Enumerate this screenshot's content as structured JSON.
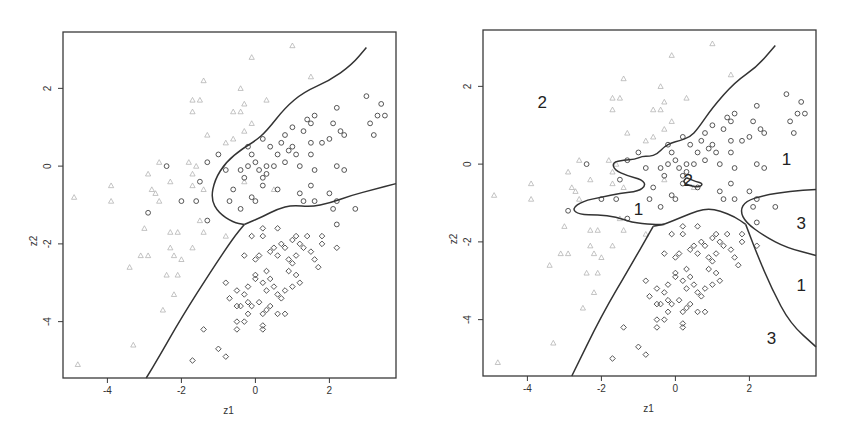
{
  "chart_data": [
    {
      "type": "scatter",
      "title": "",
      "xlabel": "z1",
      "ylabel": "z2",
      "xlim": [
        -5.2,
        3.8
      ],
      "ylim": [
        -5.45,
        3.45
      ],
      "xticks": [
        -4,
        -2,
        0,
        2
      ],
      "yticks": [
        -4,
        -2,
        0,
        2
      ],
      "grid": false,
      "legend": "none",
      "markers": {
        "class1": "circle",
        "class2": "triangle (light)",
        "class3": "diamond"
      },
      "boundaries": [
        {
          "name": "class1-vs-class2",
          "points": [
            [
              3.0,
              3.05
            ],
            [
              2.6,
              2.6
            ],
            [
              2.0,
              2.2
            ],
            [
              1.3,
              1.9
            ],
            [
              0.8,
              1.5
            ],
            [
              0.3,
              0.9
            ],
            [
              0.0,
              0.65
            ],
            [
              -0.35,
              0.45
            ],
            [
              -0.8,
              0.1
            ],
            [
              -1.1,
              -0.35
            ],
            [
              -1.2,
              -0.85
            ],
            [
              -1.0,
              -1.2
            ],
            [
              -0.6,
              -1.45
            ],
            [
              -0.3,
              -1.5
            ]
          ]
        },
        {
          "name": "class1-vs-class3",
          "points": [
            [
              -0.3,
              -1.5
            ],
            [
              0.2,
              -1.3
            ],
            [
              0.6,
              -1.1
            ],
            [
              1.0,
              -1.0
            ],
            [
              1.5,
              -1.05
            ],
            [
              2.0,
              -0.95
            ],
            [
              2.6,
              -0.75
            ],
            [
              3.2,
              -0.6
            ],
            [
              3.8,
              -0.45
            ]
          ]
        },
        {
          "name": "class2-vs-class3",
          "points": [
            [
              -0.3,
              -1.5
            ],
            [
              -0.6,
              -1.85
            ],
            [
              -1.2,
              -2.7
            ],
            [
              -2.0,
              -3.9
            ],
            [
              -2.6,
              -4.9
            ],
            [
              -2.95,
              -5.45
            ]
          ]
        }
      ]
    },
    {
      "type": "scatter",
      "title": "",
      "xlabel": "z1",
      "ylabel": "z2",
      "xlim": [
        -5.2,
        3.8
      ],
      "ylim": [
        -5.45,
        3.45
      ],
      "xticks": [
        -4,
        -2,
        0,
        2
      ],
      "yticks": [
        -4,
        -2,
        0,
        2
      ],
      "grid": false,
      "legend": "none",
      "region_labels": [
        {
          "text": "2",
          "x": -3.6,
          "y": 1.55
        },
        {
          "text": "1",
          "x": 3.0,
          "y": 0.1
        },
        {
          "text": "1",
          "x": -1.0,
          "y": -1.2
        },
        {
          "text": "2",
          "x": 0.35,
          "y": -0.45
        },
        {
          "text": "3",
          "x": 3.4,
          "y": -1.55
        },
        {
          "text": "1",
          "x": 3.4,
          "y": -3.15
        },
        {
          "text": "3",
          "x": 2.6,
          "y": -4.5
        }
      ],
      "boundaries": [
        {
          "name": "upper",
          "points": [
            [
              2.7,
              3.05
            ],
            [
              2.2,
              2.5
            ],
            [
              1.6,
              2.1
            ],
            [
              1.0,
              1.45
            ],
            [
              0.6,
              0.9
            ],
            [
              0.4,
              0.7
            ],
            [
              0.1,
              0.6
            ],
            [
              -0.1,
              0.55
            ],
            [
              -0.3,
              0.45
            ],
            [
              -0.5,
              0.25
            ],
            [
              -0.7,
              0.2
            ],
            [
              -0.9,
              0.2
            ],
            [
              -1.1,
              0.12
            ],
            [
              -1.4,
              0.1
            ],
            [
              -1.7,
              0.05
            ],
            [
              -1.65,
              -0.15
            ],
            [
              -1.3,
              -0.3
            ],
            [
              -0.9,
              -0.4
            ],
            [
              -0.8,
              -0.55
            ],
            [
              -1.0,
              -0.7
            ],
            [
              -1.5,
              -0.75
            ],
            [
              -2.0,
              -0.85
            ],
            [
              -2.5,
              -0.95
            ],
            [
              -2.8,
              -1.15
            ],
            [
              -2.6,
              -1.3
            ],
            [
              -2.1,
              -1.3
            ],
            [
              -1.6,
              -1.35
            ],
            [
              -1.2,
              -1.5
            ],
            [
              -0.6,
              -1.55
            ],
            [
              -0.3,
              -1.55
            ]
          ]
        },
        {
          "name": "small-loop",
          "points": [
            [
              0.3,
              -0.35
            ],
            [
              0.55,
              -0.45
            ],
            [
              0.75,
              -0.5
            ],
            [
              0.65,
              -0.6
            ],
            [
              0.35,
              -0.55
            ],
            [
              0.2,
              -0.45
            ],
            [
              0.3,
              -0.35
            ]
          ]
        },
        {
          "name": "middle",
          "points": [
            [
              -0.6,
              -1.6
            ],
            [
              -0.3,
              -1.55
            ],
            [
              0.2,
              -1.35
            ],
            [
              0.6,
              -1.2
            ],
            [
              0.9,
              -1.15
            ],
            [
              1.2,
              -1.2
            ],
            [
              1.6,
              -1.35
            ],
            [
              1.9,
              -1.55
            ]
          ]
        },
        {
          "name": "left-wedge",
          "points": [
            [
              -0.6,
              -1.6
            ],
            [
              -1.2,
              -2.6
            ],
            [
              -2.0,
              -3.9
            ],
            [
              -2.8,
              -5.45
            ]
          ]
        },
        {
          "name": "right-lower",
          "points": [
            [
              1.9,
              -1.55
            ],
            [
              2.2,
              -2.3
            ],
            [
              2.6,
              -3.2
            ],
            [
              3.1,
              -4.1
            ],
            [
              3.8,
              -4.7
            ]
          ]
        },
        {
          "name": "class3-pocket",
          "points": [
            [
              3.8,
              -0.65
            ],
            [
              3.1,
              -0.7
            ],
            [
              2.4,
              -0.8
            ],
            [
              1.9,
              -0.95
            ],
            [
              1.75,
              -1.2
            ],
            [
              1.9,
              -1.5
            ],
            [
              2.4,
              -1.85
            ],
            [
              3.0,
              -2.15
            ],
            [
              3.8,
              -2.35
            ]
          ]
        }
      ]
    }
  ],
  "panels": [
    {
      "xlabel": "z1",
      "ylabel": "z2",
      "xticks": [
        "-4",
        "-2",
        "0",
        "2"
      ],
      "yticks": [
        "2",
        "0",
        "-2",
        "-4"
      ]
    },
    {
      "xlabel": "z1",
      "ylabel": "z2",
      "xticks": [
        "-4",
        "-2",
        "0",
        "2"
      ],
      "yticks": [
        "2",
        "0",
        "-2",
        "-4"
      ]
    }
  ],
  "points": {
    "class1_circles": [
      [
        -0.2,
        0.5
      ],
      [
        -0.1,
        0.3
      ],
      [
        0.0,
        0.1
      ],
      [
        0.1,
        -0.1
      ],
      [
        -0.3,
        -0.3
      ],
      [
        0.2,
        -0.3
      ],
      [
        0.3,
        -0.2
      ],
      [
        0.5,
        0.0
      ],
      [
        0.6,
        0.3
      ],
      [
        0.7,
        0.6
      ],
      [
        0.8,
        0.8
      ],
      [
        1.0,
        0.5
      ],
      [
        1.1,
        0.3
      ],
      [
        1.2,
        0.0
      ],
      [
        1.3,
        0.9
      ],
      [
        1.5,
        1.1
      ],
      [
        1.6,
        1.3
      ],
      [
        1.8,
        0.6
      ],
      [
        2.0,
        0.7
      ],
      [
        2.1,
        1.1
      ],
      [
        2.2,
        1.5
      ],
      [
        2.3,
        0.9
      ],
      [
        2.4,
        0.8
      ],
      [
        2.2,
        0.0
      ],
      [
        2.4,
        -0.1
      ],
      [
        1.5,
        0.6
      ],
      [
        1.5,
        0.3
      ],
      [
        1.6,
        -0.1
      ],
      [
        0.9,
        0.4
      ],
      [
        0.4,
        0.5
      ],
      [
        0.2,
        0.7
      ],
      [
        -0.4,
        -0.1
      ],
      [
        -0.6,
        -0.6
      ],
      [
        -0.8,
        -0.1
      ],
      [
        -1.0,
        0.3
      ],
      [
        -1.3,
        0.1
      ],
      [
        -1.5,
        -0.4
      ],
      [
        -2.4,
        0.0
      ],
      [
        -2.0,
        -0.9
      ],
      [
        -1.6,
        -0.9
      ],
      [
        -0.7,
        -0.9
      ],
      [
        -0.4,
        -1.1
      ],
      [
        -0.1,
        -0.8
      ],
      [
        0.0,
        -0.9
      ],
      [
        0.6,
        -0.6
      ],
      [
        1.2,
        -0.7
      ],
      [
        1.3,
        -0.9
      ],
      [
        1.5,
        -0.5
      ],
      [
        1.6,
        -0.9
      ],
      [
        2.0,
        -0.7
      ],
      [
        2.2,
        -0.9
      ],
      [
        2.1,
        -1.1
      ],
      [
        2.2,
        -1.5
      ],
      [
        2.7,
        -1.1
      ],
      [
        3.0,
        1.8
      ],
      [
        3.3,
        1.3
      ],
      [
        3.4,
        1.6
      ],
      [
        3.5,
        1.3
      ],
      [
        3.1,
        1.1
      ],
      [
        3.2,
        0.8
      ],
      [
        -2.9,
        -1.2
      ],
      [
        -1.3,
        -1.4
      ],
      [
        0.2,
        -0.5
      ],
      [
        0.8,
        0.1
      ],
      [
        1.0,
        1.0
      ],
      [
        1.4,
        1.2
      ],
      [
        0.3,
        0.0
      ],
      [
        -0.2,
        0.0
      ]
    ],
    "class2_triangles": [
      [
        -0.1,
        2.8
      ],
      [
        1.0,
        3.1
      ],
      [
        1.5,
        2.3
      ],
      [
        -1.4,
        2.2
      ],
      [
        -0.4,
        2.0
      ],
      [
        -1.7,
        1.7
      ],
      [
        -1.5,
        1.7
      ],
      [
        -1.7,
        1.4
      ],
      [
        0.3,
        1.7
      ],
      [
        -0.6,
        1.4
      ],
      [
        -0.4,
        1.4
      ],
      [
        -0.3,
        1.6
      ],
      [
        -0.3,
        0.9
      ],
      [
        -0.1,
        1.1
      ],
      [
        -1.3,
        0.8
      ],
      [
        -0.8,
        0.6
      ],
      [
        -0.6,
        0.7
      ],
      [
        -2.6,
        0.1
      ],
      [
        -2.3,
        -0.4
      ],
      [
        -1.8,
        0.1
      ],
      [
        -1.6,
        0.0
      ],
      [
        -1.7,
        -0.2
      ],
      [
        -2.9,
        -0.2
      ],
      [
        -2.8,
        -0.6
      ],
      [
        -2.7,
        -0.7
      ],
      [
        -2.6,
        -0.9
      ],
      [
        -3.9,
        -0.5
      ],
      [
        -3.9,
        -0.9
      ],
      [
        -4.9,
        -0.8
      ],
      [
        -1.4,
        -0.6
      ],
      [
        -1.7,
        -0.5
      ],
      [
        -1.5,
        -1.4
      ],
      [
        -2.3,
        -1.7
      ],
      [
        -2.1,
        -1.7
      ],
      [
        -1.4,
        -1.7
      ],
      [
        -1.7,
        -2.1
      ],
      [
        -0.8,
        -1.8
      ],
      [
        -2.3,
        -2.1
      ],
      [
        -2.2,
        -2.3
      ],
      [
        -2.0,
        -2.4
      ],
      [
        -3.1,
        -2.3
      ],
      [
        -2.9,
        -2.3
      ],
      [
        -3.4,
        -2.6
      ],
      [
        -2.4,
        -2.8
      ],
      [
        -2.1,
        -2.8
      ],
      [
        -2.2,
        -3.3
      ],
      [
        -2.5,
        -3.7
      ],
      [
        -3.3,
        -4.6
      ],
      [
        -4.8,
        -5.1
      ],
      [
        -3.0,
        -1.6
      ],
      [
        0.5,
        -0.6
      ],
      [
        -0.3,
        -0.4
      ]
    ],
    "class3_diamonds": [
      [
        0.2,
        -1.6
      ],
      [
        0.6,
        -1.6
      ],
      [
        -0.1,
        -1.8
      ],
      [
        0.2,
        -1.8
      ],
      [
        0.5,
        -2.1
      ],
      [
        0.7,
        -2.0
      ],
      [
        0.8,
        -2.1
      ],
      [
        1.0,
        -1.9
      ],
      [
        1.1,
        -1.8
      ],
      [
        1.2,
        -2.0
      ],
      [
        1.3,
        -2.1
      ],
      [
        1.4,
        -1.8
      ],
      [
        1.5,
        -2.2
      ],
      [
        1.6,
        -2.4
      ],
      [
        1.7,
        -2.6
      ],
      [
        1.8,
        -1.8
      ],
      [
        1.8,
        -2.0
      ],
      [
        2.2,
        -2.1
      ],
      [
        1.1,
        -2.3
      ],
      [
        1.0,
        -2.5
      ],
      [
        0.9,
        -2.4
      ],
      [
        0.6,
        -2.3
      ],
      [
        0.4,
        -2.2
      ],
      [
        0.1,
        -2.3
      ],
      [
        0.0,
        -2.4
      ],
      [
        -0.3,
        -2.3
      ],
      [
        0.3,
        -2.7
      ],
      [
        0.4,
        -2.9
      ],
      [
        0.5,
        -3.1
      ],
      [
        0.6,
        -3.3
      ],
      [
        0.7,
        -3.4
      ],
      [
        0.8,
        -3.2
      ],
      [
        1.0,
        -3.1
      ],
      [
        1.1,
        -2.8
      ],
      [
        1.2,
        -3.0
      ],
      [
        0.2,
        -3.0
      ],
      [
        0.0,
        -2.8
      ],
      [
        -0.2,
        -3.1
      ],
      [
        -0.3,
        -3.3
      ],
      [
        -0.8,
        -3.0
      ],
      [
        -0.5,
        -3.2
      ],
      [
        -0.7,
        -3.4
      ],
      [
        -0.5,
        -3.6
      ],
      [
        -0.4,
        -3.6
      ],
      [
        -0.2,
        -3.5
      ],
      [
        -0.1,
        -3.6
      ],
      [
        0.1,
        -3.5
      ],
      [
        0.2,
        -3.8
      ],
      [
        0.3,
        -3.7
      ],
      [
        0.4,
        -3.6
      ],
      [
        0.6,
        -3.8
      ],
      [
        0.8,
        -3.8
      ],
      [
        -0.2,
        -3.8
      ],
      [
        -0.5,
        -4.0
      ],
      [
        -0.3,
        -4.0
      ],
      [
        0.2,
        -4.1
      ],
      [
        0.2,
        -4.2
      ],
      [
        -0.5,
        -4.2
      ],
      [
        -1.4,
        -4.2
      ],
      [
        -1.0,
        -4.7
      ],
      [
        -0.8,
        -4.9
      ],
      [
        -1.7,
        -5.0
      ],
      [
        0.0,
        -2.9
      ],
      [
        0.3,
        -3.2
      ],
      [
        0.9,
        -2.7
      ]
    ]
  }
}
